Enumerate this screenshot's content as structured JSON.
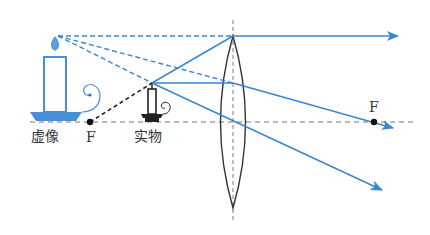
{
  "diagram": {
    "title": "",
    "type": "convex lens magnifier ray diagram",
    "colors": {
      "ray": "#3a86cf",
      "virtual_candle": "#4a8fd6",
      "real_candle": "#222222",
      "axis": "#777777",
      "lens": "#333333",
      "virtual_ray": "#3a86cf",
      "construction_line": "#222222"
    },
    "labels": {
      "virtual_image": "虚像",
      "focus_left": "F",
      "real_object": "实物",
      "focus_right": "F"
    },
    "elements": {
      "optical_axis": {
        "y": 122,
        "x_start": 30,
        "x_end": 415
      },
      "lens": {
        "center_x": 233,
        "top_y": 36,
        "bottom_y": 208,
        "half_width": 16
      },
      "lens_axis": {
        "x": 233,
        "y_start": 22,
        "y_end": 218
      },
      "focus_points": [
        {
          "name": "F",
          "x": 90,
          "y": 122
        },
        {
          "name": "F",
          "x": 374,
          "y": 122
        }
      ],
      "real_object": {
        "base_x": 152,
        "top_y": 83
      },
      "virtual_image": {
        "base_x": 55,
        "top_y": 36
      }
    }
  }
}
